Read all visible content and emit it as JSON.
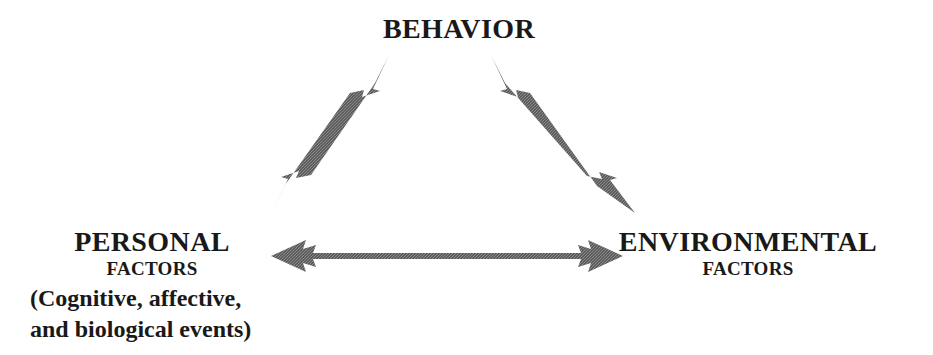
{
  "diagram": {
    "background_color": "#ffffff",
    "text_color": "#191919",
    "arrow_color": "#585858",
    "nodes": [
      {
        "id": "behavior",
        "primary": "BEHAVIOR",
        "secondary": "",
        "detail_lines": []
      },
      {
        "id": "personal",
        "primary": "PERSONAL",
        "secondary": "FACTORS",
        "detail_lines": [
          "(Cognitive, affective,",
          "and biological events)"
        ]
      },
      {
        "id": "environmental",
        "primary": "ENVIRONMENTAL",
        "secondary": "FACTORS",
        "detail_lines": []
      }
    ],
    "connectors": [
      {
        "id": "personal-behavior",
        "from": "personal",
        "to": "behavior",
        "style": "double-headed-arrow",
        "orientation": "diagonal-up-right"
      },
      {
        "id": "behavior-environmental",
        "from": "behavior",
        "to": "environmental",
        "style": "double-headed-arrow",
        "orientation": "diagonal-down-right"
      },
      {
        "id": "personal-environmental",
        "from": "personal",
        "to": "environmental",
        "style": "double-headed-arrow",
        "orientation": "horizontal"
      }
    ]
  }
}
